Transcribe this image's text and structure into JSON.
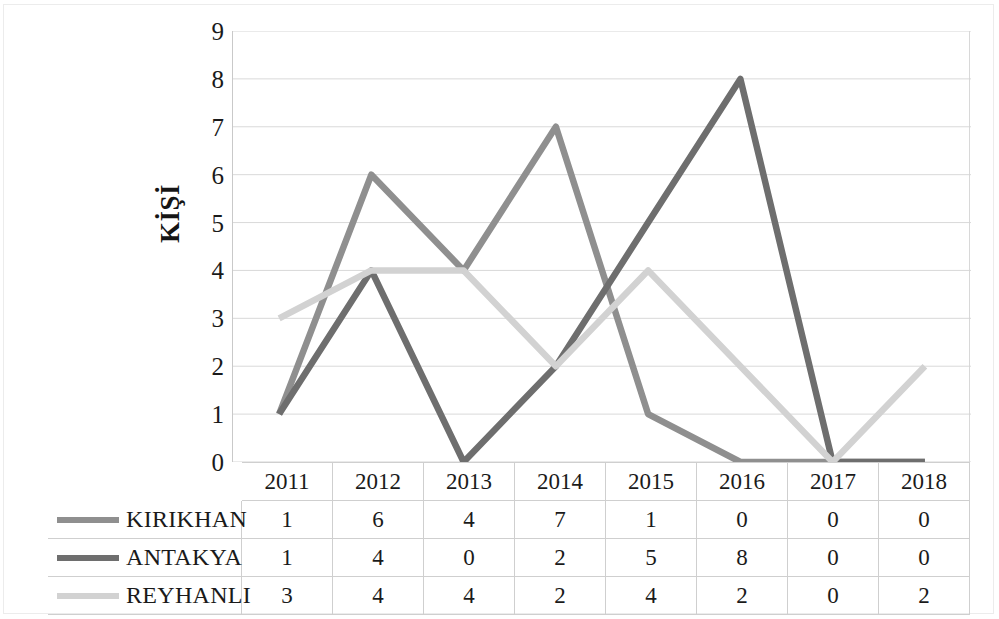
{
  "chart_data": {
    "type": "line",
    "title": "",
    "subtitle": "",
    "xlabel": "",
    "ylabel": "KİŞİ",
    "categories": [
      "2011",
      "2012",
      "2013",
      "2014",
      "2015",
      "2016",
      "2017",
      "2018"
    ],
    "ylim": [
      0,
      9
    ],
    "yticks": [
      9,
      8,
      7,
      6,
      5,
      4,
      3,
      2,
      1,
      0
    ],
    "grid": "horizontal",
    "legend_position": "table-left",
    "series": [
      {
        "name": "KIRIKHAN",
        "values": [
          1,
          6,
          4,
          7,
          1,
          0,
          0,
          0
        ],
        "color": "#8f8f8f"
      },
      {
        "name": "ANTAKYA",
        "values": [
          1,
          4,
          0,
          2,
          5,
          8,
          0,
          0
        ],
        "color": "#6e6e6e"
      },
      {
        "name": "REYHANLI",
        "values": [
          3,
          4,
          4,
          2,
          4,
          2,
          0,
          2
        ],
        "color": "#d2d2d2"
      }
    ]
  },
  "table": {
    "corner_label": "",
    "column_headers": [
      "2011",
      "2012",
      "2013",
      "2014",
      "2015",
      "2016",
      "2017",
      "2018"
    ],
    "rows": [
      {
        "label": "KIRIKHAN",
        "values": [
          "1",
          "6",
          "4",
          "7",
          "1",
          "0",
          "0",
          "0"
        ]
      },
      {
        "label": "ANTAKYA",
        "values": [
          "1",
          "4",
          "0",
          "2",
          "5",
          "8",
          "0",
          "0"
        ]
      },
      {
        "label": "REYHANLI",
        "values": [
          "3",
          "4",
          "4",
          "2",
          "4",
          "2",
          "0",
          "2"
        ]
      }
    ]
  },
  "colors": {
    "series_kirikhan": "#8f8f8f",
    "series_antakya": "#6e6e6e",
    "series_reyhanli": "#d2d2d2",
    "gridline": "#d5d5d5",
    "text": "#1a1a1a",
    "background": "#ffffff"
  }
}
